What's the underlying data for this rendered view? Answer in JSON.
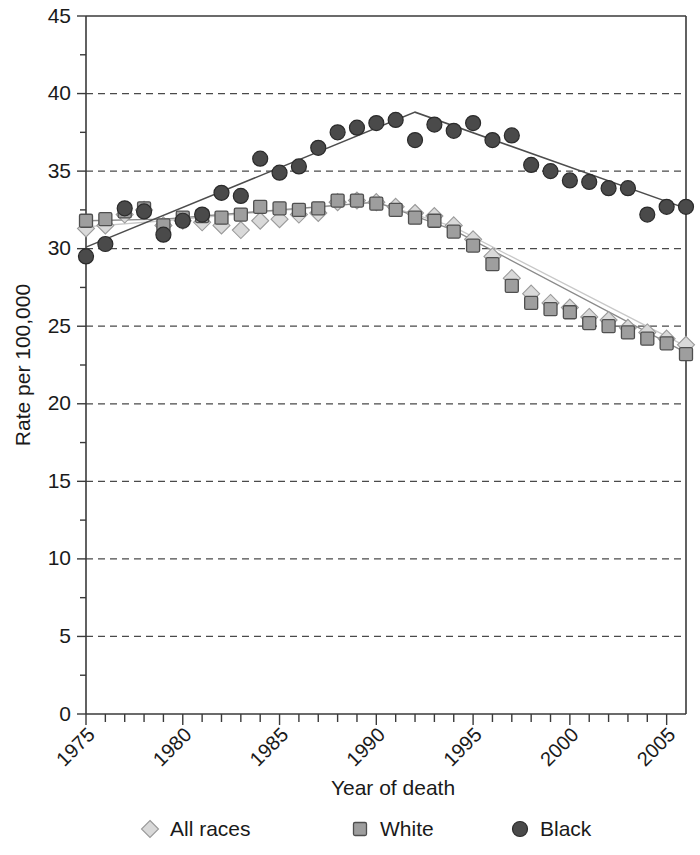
{
  "chart_data": {
    "type": "scatter",
    "title": "",
    "xlabel": "Year of death",
    "ylabel": "Rate per 100,000",
    "xlim": [
      1975,
      2006
    ],
    "ylim": [
      0,
      45
    ],
    "ytick_values": [
      0,
      5,
      10,
      15,
      20,
      25,
      30,
      35,
      40,
      45
    ],
    "ytick_labels": [
      "0",
      "5",
      "10",
      "15",
      "20",
      "25",
      "30",
      "35",
      "40",
      "45"
    ],
    "xtick_values": [
      1975,
      1980,
      1985,
      1990,
      1995,
      2000,
      2005
    ],
    "xtick_labels": [
      "1975",
      "1980",
      "1985",
      "1990",
      "1995",
      "2000",
      "2005"
    ],
    "xtick_minor_step": 1,
    "grid": "horizontal-dashed",
    "legend_position": "below",
    "x": [
      1975,
      1976,
      1977,
      1978,
      1979,
      1980,
      1981,
      1982,
      1983,
      1984,
      1985,
      1986,
      1987,
      1988,
      1989,
      1990,
      1991,
      1992,
      1993,
      1994,
      1995,
      1996,
      1997,
      1998,
      1999,
      2000,
      2001,
      2002,
      2003,
      2004,
      2005,
      2006
    ],
    "series": [
      {
        "name": "All races",
        "marker": "diamond",
        "color": "#d9d9d9",
        "values": [
          31.3,
          31.5,
          32.2,
          32.5,
          31.5,
          31.8,
          31.7,
          31.5,
          31.2,
          31.8,
          31.9,
          32.2,
          32.3,
          33.0,
          33.1,
          33.0,
          32.7,
          32.3,
          32.1,
          31.5,
          30.6,
          29.5,
          28.1,
          27.1,
          26.5,
          26.2,
          25.6,
          25.4,
          24.9,
          24.6,
          24.2,
          23.8
        ]
      },
      {
        "name": "White",
        "marker": "square",
        "color": "#9e9e9e",
        "values": [
          31.8,
          31.9,
          32.4,
          32.6,
          31.5,
          32.0,
          32.1,
          32.0,
          32.2,
          32.7,
          32.6,
          32.5,
          32.6,
          33.1,
          33.1,
          32.9,
          32.5,
          32.0,
          31.8,
          31.1,
          30.2,
          29.0,
          27.6,
          26.5,
          26.1,
          25.9,
          25.2,
          25.0,
          24.6,
          24.2,
          23.9,
          23.2
        ]
      },
      {
        "name": "Black",
        "marker": "circle",
        "color": "#4a4a4a",
        "values": [
          29.5,
          30.3,
          32.6,
          32.4,
          30.9,
          31.8,
          32.2,
          33.6,
          33.4,
          35.8,
          34.9,
          35.3,
          36.5,
          37.5,
          37.8,
          38.1,
          38.3,
          37.0,
          38.0,
          37.6,
          38.1,
          37.0,
          37.3,
          35.4,
          35.0,
          34.4,
          34.3,
          33.9,
          33.9,
          32.2,
          32.7,
          32.7
        ]
      }
    ],
    "trendlines": [
      {
        "name": "All races trend",
        "color": "#c8c8c8",
        "points": [
          [
            1975,
            31.4
          ],
          [
            1979,
            31.8
          ],
          [
            1990,
            33.0
          ],
          [
            1994,
            31.4
          ],
          [
            2006,
            23.7
          ]
        ]
      },
      {
        "name": "White trend",
        "color": "#8a8a8a",
        "points": [
          [
            1975,
            31.8
          ],
          [
            1979,
            31.9
          ],
          [
            1990,
            33.0
          ],
          [
            1994,
            31.2
          ],
          [
            2006,
            23.3
          ]
        ]
      },
      {
        "name": "Black trend",
        "color": "#4d4d4d",
        "points": [
          [
            1975,
            30.1
          ],
          [
            1992,
            38.8
          ],
          [
            2006,
            32.6
          ]
        ]
      }
    ],
    "legend": [
      {
        "label": "All races",
        "marker": "diamond",
        "color": "#d9d9d9"
      },
      {
        "label": "White",
        "marker": "square",
        "color": "#9e9e9e"
      },
      {
        "label": "Black",
        "marker": "circle",
        "color": "#4a4a4a"
      }
    ]
  }
}
